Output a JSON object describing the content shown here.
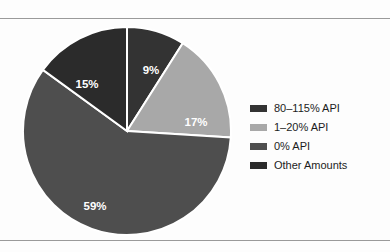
{
  "figure": {
    "background_color": "#fdfdfd",
    "rule_color": "#9a9a9a"
  },
  "chart_data": {
    "type": "pie",
    "title": "",
    "subtitle": "",
    "xlabel": "",
    "ylabel": "",
    "grid": false,
    "legend_position": "right",
    "start_angle_deg": 0,
    "direction": "clockwise",
    "label_format": "percent",
    "categories": [
      "80–115% API",
      "1–20% API",
      "0% API",
      "Other Amounts"
    ],
    "values": [
      9,
      17,
      59,
      15
    ],
    "labels": [
      "9%",
      "17%",
      "59%",
      "15%"
    ],
    "colors": [
      "#333333",
      "#a8a8a8",
      "#4e4e4e",
      "#2b2b2b"
    ],
    "slice_border_color": "#ffffff",
    "slices": [
      {
        "label": "80–115% API",
        "value": 9,
        "display": "9%",
        "color": "#333333",
        "label_x": 129,
        "label_y": 45,
        "label_color": "#ffffff"
      },
      {
        "label": "1–20% API",
        "value": 17,
        "display": "17%",
        "color": "#a8a8a8",
        "label_x": 174,
        "label_y": 97,
        "label_color": "#ffffff"
      },
      {
        "label": "0% API",
        "value": 59,
        "display": "59%",
        "color": "#4e4e4e",
        "label_x": 73,
        "label_y": 181,
        "label_color": "#ffffff"
      },
      {
        "label": "Other Amounts",
        "value": 15,
        "display": "15%",
        "color": "#2b2b2b",
        "label_x": 65,
        "label_y": 59,
        "label_color": "#ffffff"
      }
    ]
  },
  "legend": {
    "items": [
      {
        "label": "80–115% API",
        "color": "#333333"
      },
      {
        "label": "1–20% API",
        "color": "#a8a8a8"
      },
      {
        "label": "0% API",
        "color": "#4e4e4e"
      },
      {
        "label": "Other Amounts",
        "color": "#2b2b2b"
      }
    ]
  }
}
